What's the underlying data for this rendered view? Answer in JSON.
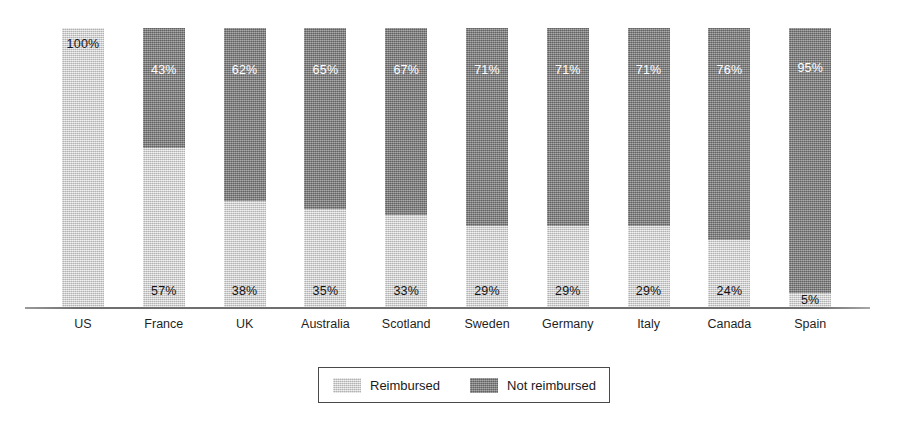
{
  "chart_data": {
    "type": "bar",
    "subtype": "stacked-100-percent",
    "title": "",
    "subtitle": "",
    "xlabel": "",
    "ylabel": "",
    "ylim": [
      0,
      100
    ],
    "grid": false,
    "legend_position": "bottom-center",
    "value_suffix": "%",
    "categories": [
      "US",
      "France",
      "UK",
      "Australia",
      "Scotland",
      "Sweden",
      "Germany",
      "Italy",
      "Canada",
      "Spain"
    ],
    "series": [
      {
        "name": "Reimbursed",
        "color": "#c9c9c9",
        "values": [
          100,
          57,
          38,
          35,
          33,
          29,
          29,
          29,
          24,
          5
        ],
        "labels": [
          "100%",
          "57%",
          "38%",
          "35%",
          "33%",
          "29%",
          "29%",
          "29%",
          "24%",
          "5%"
        ]
      },
      {
        "name": "Not reimbursed",
        "color": "#7e7e7e",
        "values": [
          0,
          43,
          62,
          65,
          67,
          71,
          71,
          71,
          76,
          95
        ],
        "labels": [
          "",
          "43%",
          "62%",
          "65%",
          "67%",
          "71%",
          "71%",
          "71%",
          "76%",
          "95%"
        ]
      }
    ],
    "annotations": []
  },
  "legend": {
    "entries": [
      {
        "label": "Reimbursed",
        "swatch": "light-gray-swatch"
      },
      {
        "label": "Not reimbursed",
        "swatch": "dark-gray-swatch"
      }
    ]
  }
}
